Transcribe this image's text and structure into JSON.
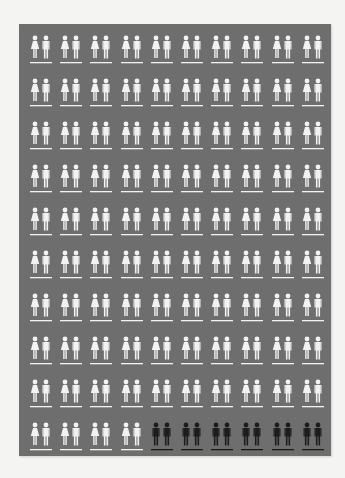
{
  "infographic": {
    "rows": 10,
    "columns": 10,
    "total_pairs": 100,
    "legend": [
      {
        "type": "woman-man",
        "color": "#f2f2f2",
        "count": 94
      },
      {
        "type": "man-man",
        "color": "#1c1c1c",
        "count": 6
      }
    ],
    "colors": {
      "background": "#f4f4f2",
      "panel": "#6e6e6e",
      "light_icon": "#f2f2f2",
      "dark_icon": "#1c1c1c"
    },
    "last_row": [
      "woman-man",
      "woman-man",
      "woman-man",
      "woman-man",
      "man-man",
      "man-man",
      "man-man",
      "man-man",
      "man-man",
      "man-man"
    ]
  }
}
